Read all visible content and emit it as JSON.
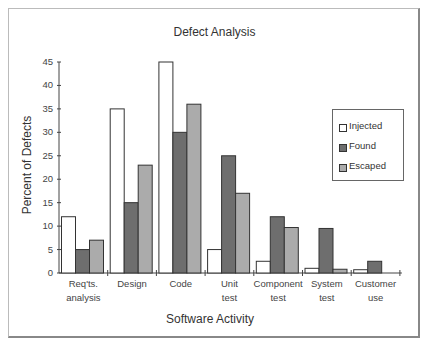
{
  "chart_data": {
    "type": "bar",
    "title": "Defect Analysis",
    "xlabel": "Software Activity",
    "ylabel": "Percent of Defects",
    "ylim": [
      0,
      45
    ],
    "yticks": [
      0,
      5,
      10,
      15,
      20,
      25,
      30,
      35,
      40,
      45
    ],
    "grid": false,
    "legend_position": "right",
    "categories": [
      [
        "Req'ts.",
        "analysis"
      ],
      [
        "Design"
      ],
      [
        "Code"
      ],
      [
        "Unit",
        "test"
      ],
      [
        "Component",
        "test"
      ],
      [
        "System",
        "test"
      ],
      [
        "Customer",
        "use"
      ]
    ],
    "series": [
      {
        "name": "Injected",
        "color": "#ffffff",
        "values": [
          12,
          35,
          45,
          5,
          2.5,
          1,
          0.7
        ]
      },
      {
        "name": "Found",
        "color": "#6e6e6e",
        "values": [
          5,
          15,
          30,
          25,
          12,
          9.5,
          2.5
        ]
      },
      {
        "name": "Escaped",
        "color": "#ababab",
        "values": [
          7,
          23,
          36,
          17,
          9.7,
          0.8,
          0
        ]
      }
    ]
  },
  "title": "Defect Analysis",
  "xlabel": "Software Activity",
  "ylabel": "Percent of Defects",
  "legend": {
    "items": [
      {
        "label": "Injected",
        "color": "#ffffff"
      },
      {
        "label": "Found",
        "color": "#6e6e6e"
      },
      {
        "label": "Escaped",
        "color": "#ababab"
      }
    ]
  }
}
